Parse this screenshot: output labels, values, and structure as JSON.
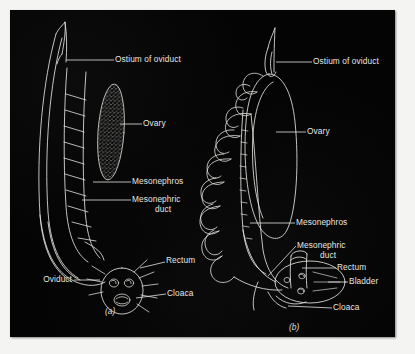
{
  "figure": {
    "background_color": "#040404",
    "line_color": "#e8e8e4",
    "panels": [
      {
        "caption": "(a)",
        "labels": [
          {
            "name": "ostium-of-oviduct",
            "text": "Ostium of oviduct"
          },
          {
            "name": "ovary",
            "text": "Ovary"
          },
          {
            "name": "mesonephros",
            "text": "Mesonephros"
          },
          {
            "name": "mesonephric-duct",
            "text": "Mesonephric"
          },
          {
            "name": "mesonephric-duct-line2",
            "text": "duct"
          },
          {
            "name": "rectum",
            "text": "Rectum"
          },
          {
            "name": "oviduct",
            "text": "Oviduct"
          },
          {
            "name": "cloaca",
            "text": "Cloaca"
          }
        ]
      },
      {
        "caption": "(b)",
        "labels": [
          {
            "name": "ostium-of-oviduct",
            "text": "Ostium of oviduct"
          },
          {
            "name": "ovary",
            "text": "Ovary"
          },
          {
            "name": "mesonephros",
            "text": "Mesonephros"
          },
          {
            "name": "mesonephric-duct",
            "text": "Mesonephric"
          },
          {
            "name": "mesonephric-duct-line2",
            "text": "duct"
          },
          {
            "name": "rectum",
            "text": "Rectum"
          },
          {
            "name": "bladder",
            "text": "Bladder"
          },
          {
            "name": "cloaca",
            "text": "Cloaca"
          }
        ]
      }
    ]
  }
}
